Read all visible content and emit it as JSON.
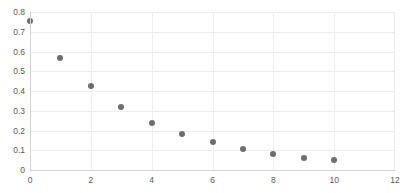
{
  "chart_data": {
    "type": "scatter",
    "title": "",
    "xlabel": "",
    "ylabel": "",
    "x": [
      0,
      1,
      2,
      3,
      4,
      5,
      6,
      7,
      8,
      9,
      10
    ],
    "values": [
      0.755,
      0.565,
      0.425,
      0.32,
      0.24,
      0.18,
      0.14,
      0.105,
      0.08,
      0.06,
      0.05
    ],
    "series": [
      {
        "name": "series-1",
        "values": [
          0.755,
          0.565,
          0.425,
          0.32,
          0.24,
          0.18,
          0.14,
          0.105,
          0.08,
          0.06,
          0.05
        ]
      }
    ],
    "xlim": [
      0,
      12
    ],
    "ylim": [
      0,
      0.8
    ],
    "xticks": [
      0,
      2,
      4,
      6,
      8,
      10,
      12
    ],
    "xtick_labels": [
      "0",
      "2",
      "4",
      "6",
      "8",
      "10",
      "12"
    ],
    "yticks": [
      0,
      0.1,
      0.2,
      0.3,
      0.4,
      0.5,
      0.6,
      0.7,
      0.8
    ],
    "ytick_labels": [
      "0",
      "0.1",
      "0.2",
      "0.3",
      "0.4",
      "0.5",
      "0.6",
      "0.7",
      "0.8"
    ],
    "grid": true,
    "legend": false,
    "marker_color": "#6e6e6e",
    "gridline_color": "#ececec",
    "axis_color": "#d3d3d3",
    "tick_label_color": "#5a5a5a"
  }
}
